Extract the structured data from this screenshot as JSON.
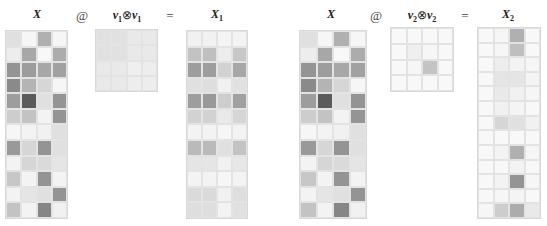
{
  "left": {
    "x_label": "X",
    "op_at": "@",
    "v_label": "v",
    "v_sub": "1",
    "otimes": "⊗",
    "v_label2": "v",
    "v_sub2": "1",
    "equals": "=",
    "result_label": "X",
    "result_sub": "1"
  },
  "right": {
    "x_label": "X",
    "op_at": "@",
    "v_label": "v",
    "v_sub": "2",
    "otimes": "⊗",
    "v_label2": "v",
    "v_sub2": "2",
    "equals": "=",
    "result_label": "X",
    "result_sub": "2"
  },
  "matrices": {
    "X": [
      [
        0.15,
        0.03,
        0.4,
        0.03
      ],
      [
        0.08,
        0.45,
        0.02,
        0.42
      ],
      [
        0.55,
        0.5,
        0.45,
        0.48
      ],
      [
        0.6,
        0.38,
        0.2,
        0.03
      ],
      [
        0.5,
        0.85,
        0.15,
        0.55
      ],
      [
        0.25,
        0.3,
        0.05,
        0.55
      ],
      [
        0.03,
        0.05,
        0.06,
        0.15
      ],
      [
        0.52,
        0.2,
        0.55,
        0.15
      ],
      [
        0.05,
        0.2,
        0.18,
        0.12
      ],
      [
        0.28,
        0.05,
        0.55,
        0.05
      ],
      [
        0.05,
        0.12,
        0.15,
        0.55
      ],
      [
        0.3,
        0.05,
        0.62,
        0.06
      ]
    ],
    "V1": [
      [
        0.14,
        0.14,
        0.1,
        0.1
      ],
      [
        0.14,
        0.14,
        0.1,
        0.1
      ],
      [
        0.1,
        0.1,
        0.07,
        0.08
      ],
      [
        0.1,
        0.1,
        0.08,
        0.08
      ]
    ],
    "X1": [
      [
        0.06,
        0.06,
        0.04,
        0.05
      ],
      [
        0.3,
        0.32,
        0.08,
        0.28
      ],
      [
        0.5,
        0.5,
        0.22,
        0.45
      ],
      [
        0.15,
        0.16,
        0.06,
        0.14
      ],
      [
        0.5,
        0.52,
        0.25,
        0.48
      ],
      [
        0.22,
        0.22,
        0.1,
        0.2
      ],
      [
        0.05,
        0.05,
        0.03,
        0.05
      ],
      [
        0.35,
        0.35,
        0.15,
        0.3
      ],
      [
        0.12,
        0.12,
        0.06,
        0.11
      ],
      [
        0.05,
        0.05,
        0.03,
        0.05
      ],
      [
        0.18,
        0.18,
        0.06,
        0.16
      ],
      [
        0.16,
        0.16,
        0.05,
        0.14
      ]
    ],
    "V2": [
      [
        0.02,
        0.02,
        0.02,
        0.02
      ],
      [
        0.02,
        0.07,
        0.03,
        0.02
      ],
      [
        0.02,
        0.03,
        0.3,
        0.02
      ],
      [
        0.02,
        0.02,
        0.02,
        0.02
      ]
    ],
    "X2": [
      [
        0.02,
        0.03,
        0.4,
        0.02
      ],
      [
        0.02,
        0.03,
        0.32,
        0.02
      ],
      [
        0.02,
        0.08,
        0.05,
        0.03
      ],
      [
        0.02,
        0.12,
        0.12,
        0.04
      ],
      [
        0.02,
        0.1,
        0.06,
        0.03
      ],
      [
        0.02,
        0.06,
        0.04,
        0.02
      ],
      [
        0.02,
        0.2,
        0.15,
        0.06
      ],
      [
        0.02,
        0.02,
        0.02,
        0.02
      ],
      [
        0.02,
        0.05,
        0.4,
        0.03
      ],
      [
        0.02,
        0.02,
        0.05,
        0.02
      ],
      [
        0.02,
        0.05,
        0.55,
        0.03
      ],
      [
        0.02,
        0.03,
        0.04,
        0.02
      ],
      [
        0.03,
        0.25,
        0.42,
        0.1
      ]
    ]
  },
  "caption": ""
}
